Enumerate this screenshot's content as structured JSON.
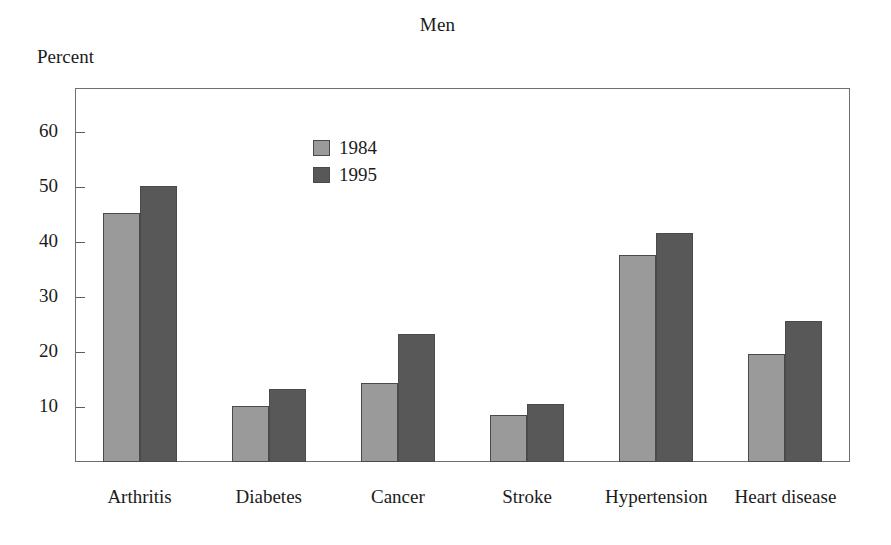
{
  "chart_data": {
    "type": "bar",
    "title": "Men",
    "xlabel": "",
    "ylabel": "Percent",
    "ylim": [
      0,
      68
    ],
    "yticks": [
      10,
      20,
      30,
      40,
      50,
      60
    ],
    "ytick_labels": [
      "10",
      "20",
      "30",
      "40",
      "50",
      "60"
    ],
    "grid": false,
    "legend_position": "upper center",
    "categories": [
      "Arthritis",
      "Diabetes",
      "Cancer",
      "Stroke",
      "Hypertension",
      "Heart disease"
    ],
    "series": [
      {
        "name": "1984",
        "color": "#9a9a9a",
        "values": [
          45.2,
          10.2,
          14.4,
          8.5,
          37.6,
          19.7
        ]
      },
      {
        "name": "1995",
        "color": "#585858",
        "values": [
          50.2,
          13.3,
          23.2,
          10.5,
          41.6,
          25.6
        ]
      }
    ]
  },
  "axis": {
    "frame_color": "#6f6f6f"
  }
}
